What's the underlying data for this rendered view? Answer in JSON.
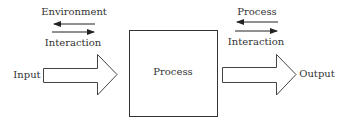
{
  "diagram": {
    "left_group": {
      "top_label": "Environment",
      "bottom_label": "Interaction"
    },
    "right_group": {
      "top_label": "Process",
      "bottom_label": "Interaction"
    },
    "input_label": "Input",
    "process_label": "Process",
    "output_label": "Output"
  }
}
